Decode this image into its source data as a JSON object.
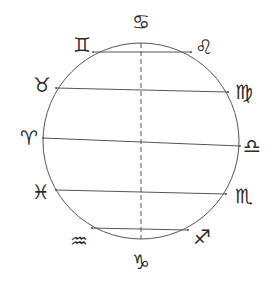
{
  "diagram": {
    "title": "",
    "type": "zodiac circle with parallel chords",
    "colors": {
      "stroke": "#555555",
      "symbol": "#2a2a2a",
      "background": "#ffffff"
    },
    "circle": {
      "cx": 141,
      "cy": 141,
      "r": 98
    },
    "axis": {
      "style": "dashed",
      "from_sign": "Cancer",
      "to_sign": "Capricorn"
    },
    "signs": [
      {
        "name": "Cancer",
        "glyph": "♋",
        "x": 141,
        "y": 22
      },
      {
        "name": "Leo",
        "glyph": "♌",
        "x": 204,
        "y": 47
      },
      {
        "name": "Virgo",
        "glyph": "♍",
        "x": 244,
        "y": 92
      },
      {
        "name": "Libra",
        "glyph": "♎",
        "x": 252,
        "y": 146
      },
      {
        "name": "Scorpio",
        "glyph": "♏",
        "x": 244,
        "y": 196
      },
      {
        "name": "Sagittarius",
        "glyph": "♐",
        "x": 202,
        "y": 237
      },
      {
        "name": "Capricorn",
        "glyph": "♑",
        "x": 141,
        "y": 262
      },
      {
        "name": "Aquarius",
        "glyph": "♒",
        "x": 79,
        "y": 241
      },
      {
        "name": "Pisces",
        "glyph": "♓",
        "x": 41,
        "y": 192
      },
      {
        "name": "Aries",
        "glyph": "♈",
        "x": 29,
        "y": 138
      },
      {
        "name": "Taurus",
        "glyph": "♉",
        "x": 42,
        "y": 85
      },
      {
        "name": "Gemini",
        "glyph": "♊",
        "x": 82,
        "y": 45
      }
    ],
    "chords": [
      {
        "from": "Gemini",
        "to": "Leo",
        "x1": 93,
        "y1": 52,
        "x2": 191,
        "y2": 52
      },
      {
        "from": "Taurus",
        "to": "Virgo",
        "x1": 56,
        "y1": 88,
        "x2": 228,
        "y2": 92
      },
      {
        "from": "Aries",
        "to": "Libra",
        "x1": 43,
        "y1": 138,
        "x2": 240,
        "y2": 146
      },
      {
        "from": "Pisces",
        "to": "Scorpio",
        "x1": 56,
        "y1": 190,
        "x2": 226,
        "y2": 194
      },
      {
        "from": "Aquarius",
        "to": "Sagittarius",
        "x1": 92,
        "y1": 228,
        "x2": 188,
        "y2": 230
      }
    ]
  }
}
